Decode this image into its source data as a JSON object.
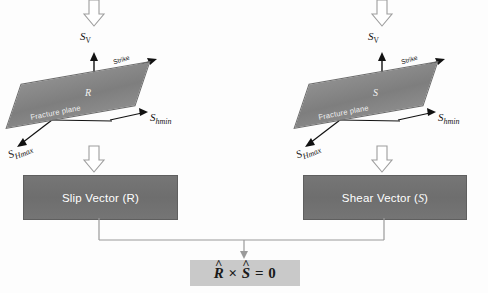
{
  "diagram": {
    "title_text": "",
    "colors": {
      "plane_fill": "#848484",
      "box_fill": "#717171",
      "eq_box_fill": "#c9c9c9",
      "line": "#9a9a9a",
      "text_dark": "#111111",
      "text_light": "#ffffff"
    },
    "left_panel": {
      "vertical_stress_label": "S",
      "vertical_stress_sub": "V",
      "strike_label": "Strike",
      "plane_label": "Fracture plane",
      "vector_letter": "R",
      "shmax_label": "S",
      "shmax_sub": "Hmax",
      "shmin_label": "S",
      "shmin_sub": "hmin",
      "box_label_pre": "Slip Vector (",
      "box_label_var": "R",
      "box_label_post": ")"
    },
    "right_panel": {
      "vertical_stress_label": "S",
      "vertical_stress_sub": "V",
      "strike_label": "Strike",
      "plane_label": "Fracture plane",
      "vector_letter": "S",
      "shmax_label": "S",
      "shmax_sub": "Hmax",
      "shmin_label": "S",
      "shmin_sub": "hmin",
      "box_label_pre": "Shear Vector (",
      "box_label_var": "S",
      "box_label_post": ")"
    },
    "equation": {
      "lhs_var": "R",
      "operator": "×",
      "rhs_var": "S",
      "equals": "=",
      "result": "0"
    },
    "icons": {
      "down_block_arrow": "hollow-down-arrow",
      "up_arrow": "solid-up-arrow",
      "connector_arrow": "connector-down-arrow"
    }
  }
}
